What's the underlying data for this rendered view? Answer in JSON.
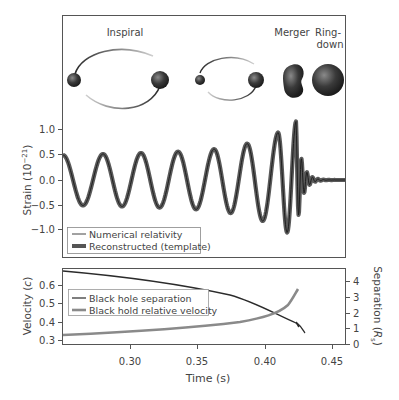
{
  "figure": {
    "stage_labels": {
      "inspiral": "Inspiral",
      "merger": "Merger",
      "ringdown_line1": "Ring-",
      "ringdown_line2": "down"
    }
  },
  "chart_data": [
    {
      "type": "line",
      "title": "",
      "xlabel": "Time (s)",
      "ylabel": "Strain (10⁻²¹)",
      "ylim": [
        -1.4,
        1.45
      ],
      "xlim": [
        0.25,
        0.46
      ],
      "yticks": [
        "1.0",
        "0.5",
        "0.0",
        "−0.5",
        "−1.0"
      ],
      "ytick_values": [
        1.0,
        0.5,
        0.0,
        -0.5,
        -1.0
      ],
      "grid": false,
      "legend_position": "lower left",
      "series": [
        {
          "name": "Numerical relativity",
          "style": "thin dark line",
          "color": "#2b2b2b"
        },
        {
          "name": "Reconstructed (template)",
          "style": "thick gray band",
          "color": "#5a5a5a"
        }
      ],
      "description": "Chirp waveform: amplitude ~0.5 at t=0.25 s, growing with increasing frequency, peaking ~1.2 near t=0.42 s, then ringdown decaying to 0 by ~0.43 s",
      "x": [
        0.25,
        0.27,
        0.29,
        0.31,
        0.33,
        0.35,
        0.37,
        0.39,
        0.4,
        0.41,
        0.415,
        0.42,
        0.425,
        0.43,
        0.46
      ],
      "envelope": [
        0.5,
        0.52,
        0.54,
        0.56,
        0.58,
        0.62,
        0.67,
        0.78,
        0.88,
        1.0,
        1.1,
        1.2,
        0.6,
        0.1,
        0.0
      ]
    },
    {
      "type": "line",
      "title": "",
      "xlabel": "Time (s)",
      "ylabel": "Velocity (c)",
      "ylabel_right": "Separation (R_s)",
      "xticks": [
        "0.30",
        "0.35",
        "0.40",
        "0.45"
      ],
      "xtick_values": [
        0.3,
        0.35,
        0.4,
        0.45
      ],
      "yticks_left": [
        "0.6",
        "0.5",
        "0.4",
        "0.3"
      ],
      "yticks_right": [
        "4",
        "3",
        "2",
        "1",
        "0"
      ],
      "ylim_left": [
        0.28,
        0.68
      ],
      "ylim_right": [
        0,
        4.5
      ],
      "legend_position": "upper left",
      "series": [
        {
          "name": "Black hole separation",
          "axis": "right",
          "color": "#2b2b2b",
          "x": [
            0.25,
            0.3,
            0.35,
            0.38,
            0.4,
            0.41,
            0.42,
            0.423
          ],
          "values": [
            4.6,
            4.4,
            4.0,
            3.6,
            3.1,
            2.7,
            2.0,
            1.4
          ]
        },
        {
          "name": "Black hold relative velocity",
          "axis": "left",
          "color": "#8a8a8a",
          "x": [
            0.25,
            0.3,
            0.35,
            0.38,
            0.4,
            0.41,
            0.42,
            0.423
          ],
          "values": [
            0.32,
            0.33,
            0.35,
            0.37,
            0.4,
            0.43,
            0.5,
            0.58
          ]
        }
      ]
    }
  ],
  "legends": {
    "top": [
      "Numerical relativity",
      "Reconstructed (template)"
    ],
    "bottom": [
      "Black hole separation",
      "Black hold relative velocity"
    ]
  },
  "axes": {
    "strain_label": "Strain (10",
    "strain_exp": "−21",
    "strain_close": ")",
    "velocity_label": "Velocity (",
    "velocity_unit": "c",
    "velocity_close": ")",
    "separation_label": "Separation (",
    "separation_unit": "R",
    "separation_sub": "s",
    "separation_close": ")",
    "time_label": "Time (s)",
    "strain_ticks": [
      "1.0",
      "0.5",
      "0.0",
      "−0.5",
      "−1.0"
    ],
    "velocity_ticks": [
      "0.6",
      "0.5",
      "0.4",
      "0.3"
    ],
    "separation_ticks": [
      "4",
      "3",
      "2",
      "1",
      "0"
    ],
    "time_ticks": [
      "0.30",
      "0.35",
      "0.40",
      "0.45"
    ]
  }
}
